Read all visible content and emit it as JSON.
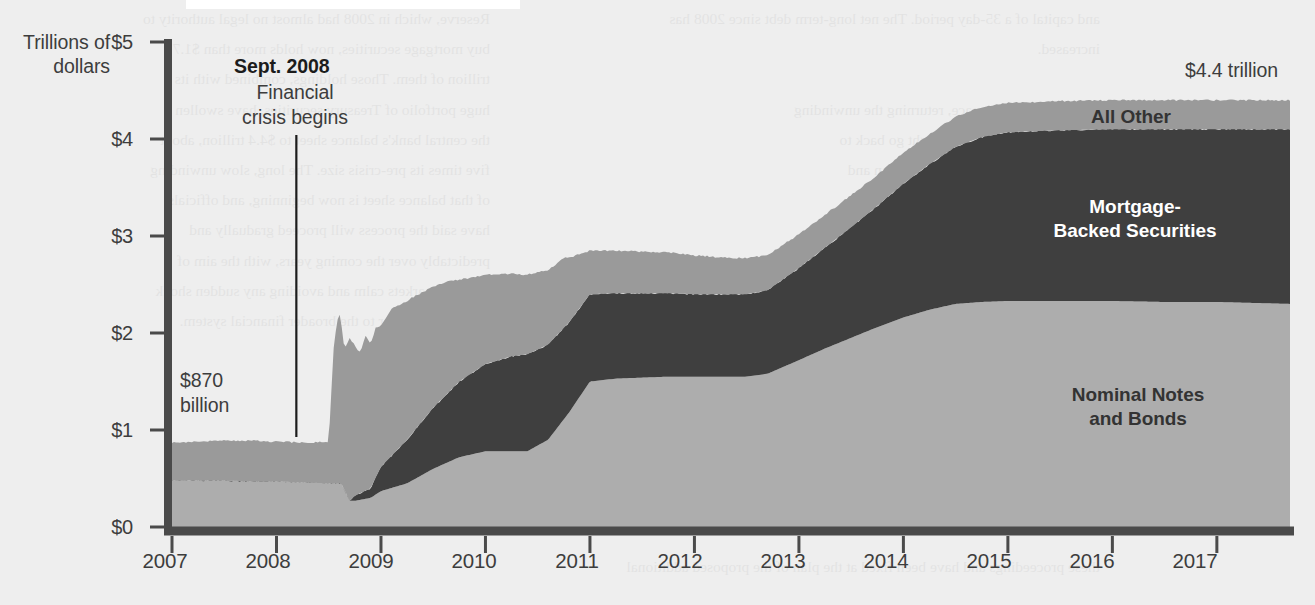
{
  "figure": {
    "background_color": "#eeeeee",
    "band_colors": {
      "nominal_notes_and_bonds": "#adadad",
      "mortgage_backed_securities": "#3f3f3f",
      "all_other": "#9a9a9a",
      "axis": "#4a4a4a"
    }
  },
  "axis": {
    "y_title_line1": "Trillions of",
    "y_title_line2": "dollars",
    "y_ticks": [
      "$0",
      "$1",
      "$2",
      "$3",
      "$4",
      "$5"
    ],
    "x_ticks": [
      "2007",
      "2008",
      "2009",
      "2010",
      "2011",
      "2012",
      "2013",
      "2014",
      "2015",
      "2016",
      "2017"
    ]
  },
  "annotations": {
    "crisis_title": "Sept. 2008",
    "crisis_sub_line1": "Financial",
    "crisis_sub_line2": "crisis begins",
    "start_value_line1": "$870",
    "start_value_line2": "billion",
    "end_value": "$4.4 trillion"
  },
  "series_labels": {
    "all_other": "All Other",
    "mbs_line1": "Mortgage-",
    "mbs_line2": "Backed Securities",
    "nominal_line1": "Nominal Notes",
    "nominal_line2": "and Bonds"
  },
  "page_bleed": {
    "left_column": "Reserve, which in 2008 had almost no legal authority to\nbuy mortgage securities, now holds more than $1.7\ntrillion of them. Those holdings, combined with its\nhuge portfolio of Treasury securities, have swollen\nthe central bank's balance sheet to $4.4 trillion, about\nfive times its pre-crisis size. The long, slow unwinding\nof that balance sheet is now beginning, and officials\nhave said the process will proceed gradually and\npredictably over the coming years, with the aim of\nkeeping markets calm and avoiding any sudden shock\nto interest rates or to the broader financial system.",
    "right_column": "and capital of a 35-day period. The net long-term debt since 2008 has\nincreased.\n\nThe plan sets out a pace, returning the unwinding\nconsideration that a firm might go back to\nwhich we reached the proposed plan and\nthe held and readjusted in a 27-to-one\nrate on compensation.",
    "footer": "these proceedings and have been fixed at the plan of the proposed additional"
  },
  "chart_data": {
    "type": "area",
    "stacked": true,
    "title": "",
    "xlabel": "",
    "ylabel": "Trillions of dollars",
    "xlim": [
      2007.0,
      2017.7
    ],
    "ylim": [
      0,
      5
    ],
    "grid": false,
    "legend": "inline-labels",
    "units": "trillions of US dollars",
    "series": [
      {
        "name": "Nominal Notes and Bonds",
        "color": "#adadad",
        "x": [
          2007.0,
          2007.25,
          2007.5,
          2007.75,
          2008.0,
          2008.25,
          2008.5,
          2008.62,
          2008.7,
          2008.75,
          2008.9,
          2009.0,
          2009.25,
          2009.5,
          2009.75,
          2010.0,
          2010.25,
          2010.4,
          2010.6,
          2010.8,
          2011.0,
          2011.25,
          2011.5,
          2011.75,
          2012.0,
          2012.25,
          2012.5,
          2012.7,
          2013.0,
          2013.25,
          2013.5,
          2013.75,
          2014.0,
          2014.25,
          2014.5,
          2014.75,
          2015.0,
          2015.5,
          2016.0,
          2016.5,
          2017.0,
          2017.7
        ],
        "values": [
          0.48,
          0.48,
          0.48,
          0.47,
          0.47,
          0.46,
          0.45,
          0.45,
          0.27,
          0.27,
          0.3,
          0.37,
          0.45,
          0.6,
          0.72,
          0.78,
          0.78,
          0.78,
          0.9,
          1.18,
          1.5,
          1.53,
          1.54,
          1.55,
          1.55,
          1.55,
          1.55,
          1.58,
          1.72,
          1.84,
          1.95,
          2.06,
          2.16,
          2.24,
          2.3,
          2.32,
          2.33,
          2.33,
          2.33,
          2.32,
          2.32,
          2.3
        ]
      },
      {
        "name": "Mortgage-Backed Securities",
        "color": "#3f3f3f",
        "x": [
          2007.0,
          2007.25,
          2007.5,
          2007.75,
          2008.0,
          2008.25,
          2008.5,
          2008.62,
          2008.7,
          2008.75,
          2008.9,
          2009.0,
          2009.25,
          2009.5,
          2009.75,
          2010.0,
          2010.25,
          2010.4,
          2010.6,
          2010.8,
          2011.0,
          2011.25,
          2011.5,
          2011.75,
          2012.0,
          2012.25,
          2012.5,
          2012.7,
          2013.0,
          2013.25,
          2013.5,
          2013.75,
          2014.0,
          2014.25,
          2014.5,
          2014.75,
          2015.0,
          2015.5,
          2016.0,
          2016.5,
          2017.0,
          2017.7
        ],
        "values": [
          0.0,
          0.0,
          0.0,
          0.0,
          0.0,
          0.0,
          0.0,
          0.0,
          0.0,
          0.05,
          0.1,
          0.25,
          0.45,
          0.63,
          0.78,
          0.9,
          0.98,
          1.0,
          0.98,
          0.93,
          0.9,
          0.88,
          0.87,
          0.86,
          0.85,
          0.85,
          0.85,
          0.86,
          0.95,
          1.04,
          1.14,
          1.25,
          1.38,
          1.5,
          1.62,
          1.7,
          1.74,
          1.76,
          1.77,
          1.78,
          1.78,
          1.8
        ]
      },
      {
        "name": "All Other",
        "color": "#9a9a9a",
        "x": [
          2007.0,
          2007.25,
          2007.5,
          2007.75,
          2008.0,
          2008.25,
          2008.4,
          2008.5,
          2008.55,
          2008.6,
          2008.65,
          2008.7,
          2008.75,
          2008.8,
          2008.85,
          2008.9,
          2008.95,
          2009.0,
          2009.1,
          2009.2,
          2009.3,
          2009.4,
          2009.5,
          2009.6,
          2009.75,
          2010.0,
          2010.25,
          2010.5,
          2010.75,
          2011.0,
          2011.25,
          2011.5,
          2011.75,
          2012.0,
          2012.25,
          2012.5,
          2012.75,
          2013.0,
          2013.25,
          2013.5,
          2013.75,
          2014.0,
          2014.25,
          2014.5,
          2014.75,
          2015.0,
          2015.5,
          2016.0,
          2016.5,
          2017.0,
          2017.7
        ],
        "values": [
          0.39,
          0.4,
          0.41,
          0.42,
          0.41,
          0.41,
          0.42,
          0.43,
          1.45,
          1.78,
          1.45,
          1.68,
          1.55,
          1.45,
          1.6,
          1.48,
          1.55,
          1.45,
          1.52,
          1.46,
          1.4,
          1.32,
          1.25,
          1.18,
          1.05,
          0.92,
          0.85,
          0.8,
          0.72,
          0.45,
          0.44,
          0.43,
          0.42,
          0.4,
          0.38,
          0.37,
          0.36,
          0.35,
          0.34,
          0.33,
          0.32,
          0.32,
          0.31,
          0.31,
          0.31,
          0.3,
          0.3,
          0.3,
          0.3,
          0.3,
          0.3
        ]
      }
    ],
    "annotations": [
      {
        "label": "$870 billion",
        "x": 2007.0,
        "y": 0.87,
        "note": "total at start of series"
      },
      {
        "label": "$4.4 trillion",
        "x": 2017.7,
        "y": 4.4,
        "note": "total at end of series"
      },
      {
        "label": "Sept. 2008 Financial crisis begins",
        "x": 2008.7,
        "type": "vline"
      }
    ]
  }
}
